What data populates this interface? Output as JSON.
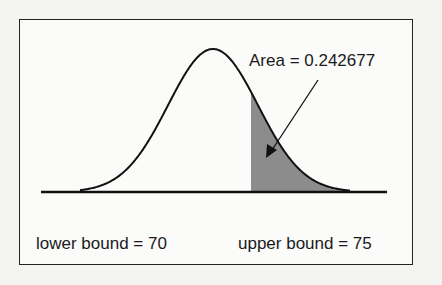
{
  "diagram": {
    "type": "normal-distribution-area",
    "area_label": "Area = 0.242677",
    "lower_label": "lower bound = 70",
    "upper_label": "upper bound = 75",
    "shade_color": "#8c8c8c",
    "line_color": "#111111"
  },
  "chart_data": {
    "type": "area",
    "title": "",
    "annotations": [
      "Area = 0.242677",
      "lower bound = 70",
      "upper bound = 75"
    ],
    "shaded_region": {
      "from": "lower bound",
      "to": "upper tail"
    },
    "area": 0.242677,
    "lower_bound": 70,
    "upper_bound": 75,
    "grid": false
  }
}
